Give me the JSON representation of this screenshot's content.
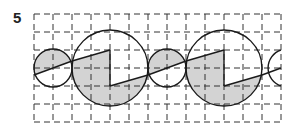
{
  "figure": {
    "number_label": "5",
    "grid": {
      "x_lines": [
        34,
        53,
        72,
        91,
        110,
        129,
        148,
        167,
        186,
        205,
        224,
        243,
        262,
        281
      ],
      "y_lines": [
        14,
        32,
        50,
        68,
        86,
        104,
        122
      ],
      "x_min": 34,
      "x_max": 281,
      "y_min": 14,
      "y_max": 122,
      "dash": "6 4",
      "color": "#333333"
    },
    "colors": {
      "stroke": "#1a1a1a",
      "fill": "#d3d3d3",
      "background": "#ffffff"
    },
    "shapes": {
      "small_circles": [
        {
          "cx": 53,
          "cy": 68,
          "r": 19
        },
        {
          "cx": 167,
          "cy": 68,
          "r": 19
        }
      ],
      "big_circles": [
        {
          "cx": 110,
          "cy": 68,
          "r": 38
        },
        {
          "cx": 224,
          "cy": 68,
          "r": 38
        }
      ],
      "partial_circle": {
        "cx": 300,
        "cy": 68,
        "r": 19
      }
    }
  }
}
